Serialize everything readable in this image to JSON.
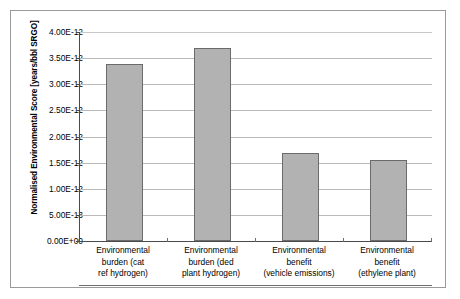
{
  "chart_data": {
    "type": "bar",
    "title": "",
    "xlabel": "",
    "ylabel": "Normalised Environmental Score [years/bbl SRGO]",
    "categories": [
      "Environmental burden (cat ref hydrogen)",
      "Environmental burden (ded plant hydrogen)",
      "Environmental benefit (vehicle emissions)",
      "Environmental benefit (ethylene plant)"
    ],
    "category_lines": [
      [
        "Environmental",
        "burden (cat",
        "ref hydrogen)"
      ],
      [
        "Environmental",
        "burden (ded",
        "plant hydrogen)"
      ],
      [
        "Environmental",
        "benefit",
        "(vehicle emissions)"
      ],
      [
        "Environmental",
        "benefit",
        "(ethylene plant)"
      ]
    ],
    "values": [
      3.39e-12,
      3.69e-12,
      1.68e-12,
      1.55e-12
    ],
    "ylim": [
      0,
      4e-12
    ],
    "ytick_values": [
      4e-12,
      3.5e-12,
      3e-12,
      2.5e-12,
      2e-12,
      1.5e-12,
      1e-12,
      5e-13,
      0
    ],
    "ytick_labels": [
      "4.00E-12",
      "3.50E-12",
      "3.00E-12",
      "2.50E-12",
      "2.00E-12",
      "1.50E-12",
      "1.00E-12",
      "5.00E-13",
      "0.00E+00"
    ],
    "grid": true,
    "legend": "none",
    "bar_fill_color": "#b2b2b2",
    "bar_border_color": "#6b6b6b",
    "gridline_color": "#b9b9b9",
    "axis_color": "#4a4a4a",
    "frame_border_color": "#9a9a9a",
    "background_color": "#ffffff"
  }
}
